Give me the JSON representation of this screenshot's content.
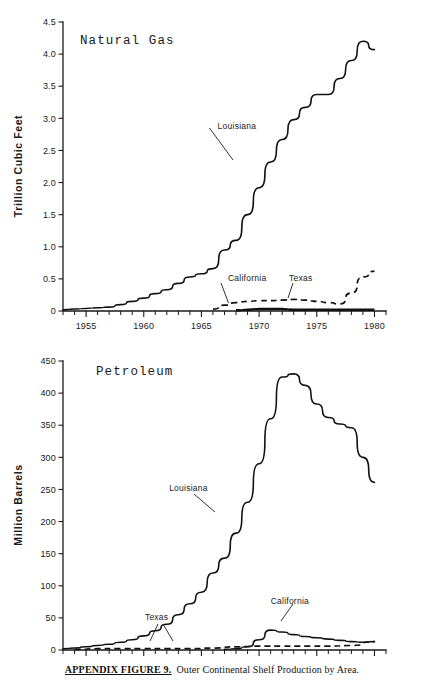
{
  "caption": {
    "bold_prefix": "APPENDIX FIGURE 9.",
    "rest": "Outer Continental Shelf Production by Area."
  },
  "chart_data": [
    {
      "type": "line",
      "title": "Natural Gas",
      "xlabel": "",
      "ylabel": "Trillion Cubic Feet",
      "xlim": [
        1953,
        1981
      ],
      "ylim": [
        0,
        4.5
      ],
      "grid": false,
      "legend": "inline-annotations",
      "xticks": [
        1955,
        1960,
        1965,
        1970,
        1975,
        1980
      ],
      "xtick_labels": [
        "1955",
        "1960",
        "1965",
        "1970",
        "1975",
        "1980"
      ],
      "minor_xtick_interval": 1,
      "yticks": [
        0,
        0.5,
        1.0,
        1.5,
        2.0,
        2.5,
        3.0,
        3.5,
        4.0,
        4.5
      ],
      "ytick_labels": [
        "0",
        "0.5",
        "1.0",
        "1.5",
        "2.0",
        "2.5",
        "3.0",
        "3.5",
        "4.0",
        "4.5"
      ],
      "series": [
        {
          "name": "Louisiana",
          "style": "solid",
          "x": [
            1953,
            1954,
            1955,
            1956,
            1957,
            1958,
            1959,
            1960,
            1961,
            1962,
            1963,
            1964,
            1965,
            1966,
            1967,
            1968,
            1969,
            1970,
            1971,
            1972,
            1973,
            1974,
            1975,
            1976,
            1977,
            1978,
            1979,
            1980
          ],
          "values": [
            0.02,
            0.03,
            0.04,
            0.05,
            0.06,
            0.1,
            0.15,
            0.2,
            0.27,
            0.33,
            0.43,
            0.53,
            0.58,
            0.66,
            0.95,
            1.1,
            1.5,
            1.92,
            2.32,
            2.67,
            2.98,
            3.17,
            3.37,
            3.37,
            3.62,
            3.9,
            4.2,
            4.07
          ]
        },
        {
          "name": "Texas",
          "style": "dashed",
          "x": [
            1966,
            1967,
            1968,
            1969,
            1970,
            1971,
            1972,
            1973,
            1974,
            1975,
            1976,
            1977,
            1978,
            1979,
            1980
          ],
          "values": [
            0.03,
            0.09,
            0.13,
            0.15,
            0.16,
            0.16,
            0.17,
            0.18,
            0.17,
            0.15,
            0.13,
            0.11,
            0.28,
            0.53,
            0.62
          ]
        },
        {
          "name": "California",
          "style": "solid-thick",
          "x": [
            1968,
            1969,
            1970,
            1971,
            1972,
            1973,
            1974,
            1975,
            1976,
            1977,
            1978,
            1979,
            1980
          ],
          "values": [
            0.01,
            0.02,
            0.03,
            0.03,
            0.03,
            0.02,
            0.02,
            0.02,
            0.02,
            0.02,
            0.02,
            0.02,
            0.02
          ]
        }
      ],
      "annotations": [
        {
          "text": "Louisiana",
          "x": 1966.4,
          "y": 2.84
        },
        {
          "text": "California",
          "x": 1967.3,
          "y": 0.47
        },
        {
          "text": "Texas",
          "x": 1972.6,
          "y": 0.47
        }
      ]
    },
    {
      "type": "line",
      "title": "Petroleum",
      "xlabel": "",
      "ylabel": "Million Barrels",
      "xlim": [
        1953,
        1981
      ],
      "ylim": [
        0,
        450
      ],
      "grid": false,
      "legend": "inline-annotations",
      "xticks": [
        1955,
        1960,
        1965,
        1970,
        1975,
        1980
      ],
      "xtick_labels": [
        "1955",
        "1960",
        "1965",
        "1970",
        "1975",
        "1980"
      ],
      "minor_xtick_interval": 1,
      "yticks": [
        0,
        50,
        100,
        150,
        200,
        250,
        300,
        350,
        400,
        450
      ],
      "ytick_labels": [
        "0",
        "50",
        "100",
        "150",
        "200",
        "250",
        "300",
        "350",
        "400",
        "450"
      ],
      "series": [
        {
          "name": "Louisiana",
          "style": "solid",
          "x": [
            1953,
            1954,
            1955,
            1956,
            1957,
            1958,
            1959,
            1960,
            1961,
            1962,
            1963,
            1964,
            1965,
            1966,
            1967,
            1968,
            1969,
            1970,
            1971,
            1972,
            1973,
            1974,
            1975,
            1976,
            1977,
            1978,
            1979,
            1980
          ],
          "values": [
            2,
            3,
            5,
            7,
            9,
            12,
            16,
            22,
            30,
            40,
            55,
            72,
            90,
            120,
            143,
            182,
            230,
            290,
            360,
            425,
            430,
            412,
            383,
            362,
            352,
            346,
            300,
            261
          ]
        },
        {
          "name": "California",
          "style": "solid",
          "x": [
            1967,
            1968,
            1969,
            1970,
            1971,
            1972,
            1973,
            1974,
            1975,
            1976,
            1977,
            1978,
            1979,
            1980
          ],
          "values": [
            1,
            2,
            5,
            16,
            31,
            28,
            24,
            21,
            19,
            17,
            15,
            13,
            12,
            13
          ]
        },
        {
          "name": "Texas",
          "style": "dashed",
          "x": [
            1954,
            1956,
            1958,
            1960,
            1962,
            1964,
            1966,
            1968,
            1970,
            1972,
            1974,
            1976,
            1978,
            1980
          ],
          "values": [
            1,
            2,
            2,
            2,
            2,
            2,
            3,
            5,
            6,
            6,
            6,
            6,
            7,
            13
          ]
        }
      ],
      "annotations": [
        {
          "text": "Louisiana",
          "x": 1962.2,
          "y": 248
        },
        {
          "text": "Texas",
          "x": 1960.1,
          "y": 47
        },
        {
          "text": "California",
          "x": 1971.0,
          "y": 72
        }
      ]
    }
  ]
}
